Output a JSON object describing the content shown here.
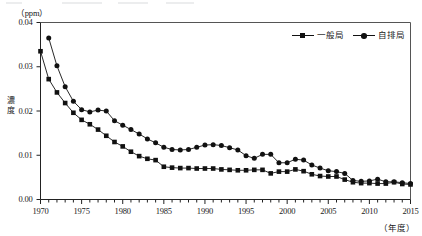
{
  "chart_data": {
    "type": "line",
    "title": "",
    "subtitle": "",
    "xlabel": "（年度）",
    "ylabel": "濃度",
    "unit_label": "（ppm）",
    "xlim": [
      1970,
      2015
    ],
    "ylim": [
      0.0,
      0.04
    ],
    "grid": false,
    "legend_position": "top-right",
    "y_ticks": [
      "0.00",
      "0.01",
      "0.02",
      "0.03",
      "0.04"
    ],
    "y_tick_values": [
      0.0,
      0.01,
      0.02,
      0.03,
      0.04
    ],
    "x_ticks": [
      "1970",
      "1975",
      "1980",
      "1985",
      "1990",
      "1995",
      "2000",
      "2005",
      "2010",
      "2015"
    ],
    "x_tick_values": [
      1970,
      1975,
      1980,
      1985,
      1990,
      1995,
      2000,
      2005,
      2010,
      2015
    ],
    "x_minor_tick_step": 1,
    "series": [
      {
        "name": "一般局",
        "marker": "square",
        "color": "#111111",
        "x": [
          1970,
          1971,
          1972,
          1973,
          1974,
          1975,
          1976,
          1977,
          1978,
          1979,
          1980,
          1981,
          1982,
          1983,
          1984,
          1985,
          1986,
          1987,
          1988,
          1989,
          1990,
          1991,
          1992,
          1993,
          1994,
          1995,
          1996,
          1997,
          1998,
          1999,
          2000,
          2001,
          2002,
          2003,
          2004,
          2005,
          2006,
          2007,
          2008,
          2009,
          2010,
          2011,
          2012,
          2013,
          2014,
          2015
        ],
        "values": [
          0.0335,
          0.0272,
          0.0242,
          0.0218,
          0.0196,
          0.018,
          0.017,
          0.0158,
          0.0144,
          0.013,
          0.012,
          0.0108,
          0.0098,
          0.0092,
          0.0089,
          0.0074,
          0.0072,
          0.0071,
          0.0071,
          0.007,
          0.007,
          0.007,
          0.0068,
          0.0067,
          0.0066,
          0.0066,
          0.0067,
          0.0067,
          0.0059,
          0.0063,
          0.0063,
          0.0068,
          0.0064,
          0.0057,
          0.0053,
          0.0052,
          0.0052,
          0.0045,
          0.0039,
          0.0037,
          0.0037,
          0.0036,
          0.0036,
          0.0039,
          0.0035,
          0.0034
        ]
      },
      {
        "name": "自排局",
        "marker": "circle",
        "color": "#111111",
        "x": [
          1971,
          1972,
          1973,
          1974,
          1975,
          1976,
          1977,
          1978,
          1979,
          1980,
          1981,
          1982,
          1983,
          1984,
          1985,
          1986,
          1987,
          1988,
          1989,
          1990,
          1991,
          1992,
          1993,
          1994,
          1995,
          1996,
          1997,
          1998,
          1999,
          2000,
          2001,
          2002,
          2003,
          2004,
          2005,
          2006,
          2007,
          2008,
          2009,
          2010,
          2011,
          2012,
          2013,
          2014,
          2015
        ],
        "values": [
          0.0365,
          0.0302,
          0.0255,
          0.0222,
          0.0203,
          0.0198,
          0.0202,
          0.02,
          0.0178,
          0.0168,
          0.0158,
          0.0148,
          0.0137,
          0.0128,
          0.0118,
          0.0113,
          0.0112,
          0.0113,
          0.0118,
          0.0123,
          0.0124,
          0.0122,
          0.0117,
          0.0112,
          0.0099,
          0.0093,
          0.0102,
          0.0102,
          0.0083,
          0.0083,
          0.0091,
          0.0089,
          0.0078,
          0.0071,
          0.0065,
          0.0063,
          0.0059,
          0.0043,
          0.0041,
          0.0042,
          0.0046,
          0.004,
          0.004,
          0.0038,
          0.0036
        ]
      }
    ]
  },
  "legend": {
    "items": [
      {
        "label": "一般局",
        "marker": "square"
      },
      {
        "label": "自排局",
        "marker": "circle"
      }
    ]
  },
  "axes": {
    "unit": "（ppm）",
    "y_title": "濃度",
    "x_title": "（年度）"
  }
}
